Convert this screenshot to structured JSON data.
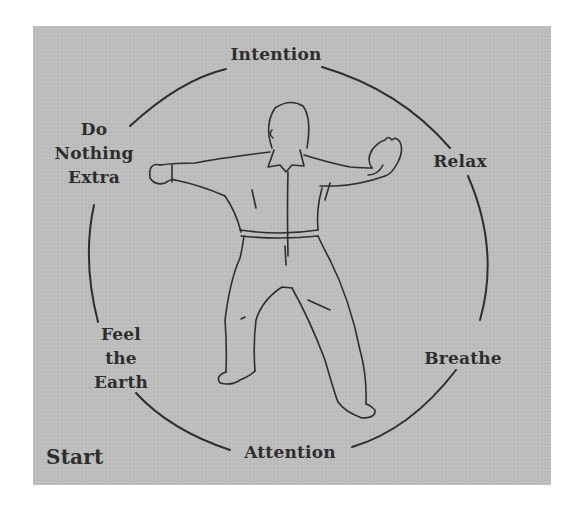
{
  "diagram": {
    "background_color": "#bdbdbd",
    "line_color": "#2e2e2e",
    "start_label": "Start",
    "cycle_labels": {
      "top": "Intention",
      "upper_right": "Relax",
      "lower_right": "Breathe",
      "bottom": "Attention",
      "lower_left": [
        "Feel",
        "the",
        "Earth"
      ],
      "upper_left": [
        "Do",
        "Nothing",
        "Extra"
      ]
    },
    "figure": "standing tai chi practitioner, arms extended, wide stance"
  }
}
